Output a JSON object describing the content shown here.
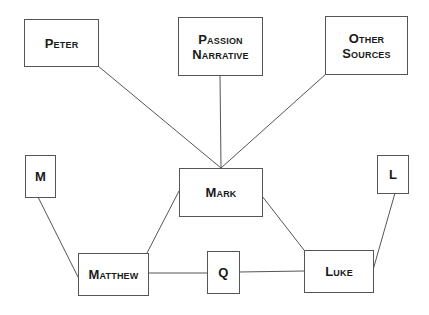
{
  "diagram": {
    "type": "source-dependency",
    "nodes": [
      {
        "id": "peter",
        "label": "Peter"
      },
      {
        "id": "passion",
        "label_line1": "Passion",
        "label_line2": "Narrative"
      },
      {
        "id": "other",
        "label_line1": "Other",
        "label_line2": "Sources"
      },
      {
        "id": "m",
        "label": "M"
      },
      {
        "id": "mark",
        "label": "Mark"
      },
      {
        "id": "l",
        "label": "L"
      },
      {
        "id": "matthew",
        "label": "Matthew"
      },
      {
        "id": "q",
        "label": "Q"
      },
      {
        "id": "luke",
        "label": "Luke"
      }
    ],
    "edges": [
      {
        "from": "Peter",
        "to": "Mark"
      },
      {
        "from": "Passion Narrative",
        "to": "Mark"
      },
      {
        "from": "Other Sources",
        "to": "Mark"
      },
      {
        "from": "M",
        "to": "Matthew"
      },
      {
        "from": "Mark",
        "to": "Matthew"
      },
      {
        "from": "Matthew",
        "to": "Q"
      },
      {
        "from": "Q",
        "to": "Luke"
      },
      {
        "from": "Mark",
        "to": "Luke"
      },
      {
        "from": "L",
        "to": "Luke"
      }
    ]
  }
}
